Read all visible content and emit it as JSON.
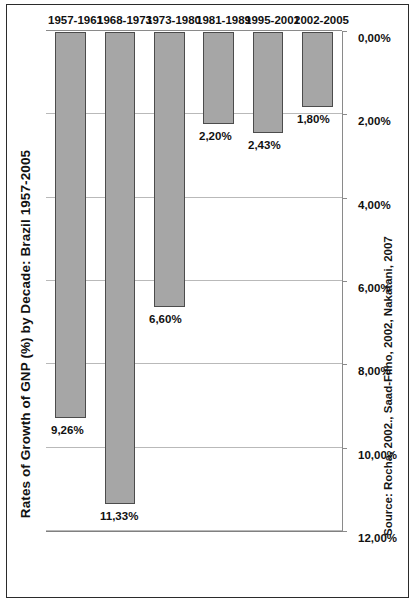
{
  "figure": {
    "title": "Rates of Growth of GNP (%)  by Decade:  Brazil 1957-2005",
    "source": "Source: Rocha, 2002., Saad-Filho, 2002, Nakatani, 2007",
    "bar_fill_color": "#a6a6a6",
    "bar_border_color": "#4c4c4c",
    "gridline_color": "#b9b9b9",
    "frame_color": "#2b2b2b"
  },
  "chart_data": {
    "type": "bar",
    "orientation": "vertical-rotated",
    "title": "Rates of Growth of GNP (%)  by Decade:  Brazil 1957-2005",
    "xlabel": "",
    "ylabel": "",
    "categories": [
      "1957-1961",
      "1968-1973",
      "1973-1980",
      "1981-1989",
      "1995-2001",
      "2002-2005"
    ],
    "values": [
      9.26,
      11.33,
      6.6,
      2.2,
      2.43,
      1.8
    ],
    "value_labels": [
      "9,26%",
      "11,33%",
      "6,60%",
      "2,20%",
      "2,43%",
      "1,80%"
    ],
    "ylim": [
      0,
      12
    ],
    "ticks": [
      0,
      2,
      4,
      6,
      8,
      10,
      12
    ],
    "tick_labels": [
      "0,00%",
      "2,00%",
      "4,00%",
      "6,00%",
      "8,00%",
      "10,00%",
      "12,00%"
    ],
    "grid": true,
    "legend": false,
    "series_name": "Rate of Growth of GNP (%)"
  }
}
